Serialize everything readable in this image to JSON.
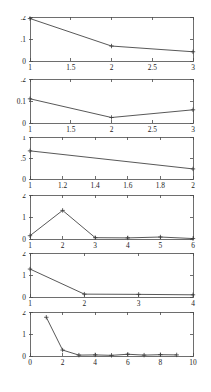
{
  "figure": {
    "title": "",
    "background_color": "#ffffff",
    "line_color": "#3a3a3a",
    "axis_color": "#4a4a4a",
    "panel_count": 6,
    "marker": "plus"
  },
  "chart_data": [
    {
      "type": "line",
      "title": "",
      "xlabel": "",
      "ylabel": "",
      "grid": false,
      "legend": null,
      "marker": "+",
      "x": [
        1,
        2,
        3
      ],
      "y": [
        0.193,
        0.068,
        0.042
      ],
      "xlim": [
        1,
        3
      ],
      "ylim": [
        0,
        0.2
      ],
      "xticks": [
        1,
        1.5,
        2,
        2.5,
        3
      ],
      "xticklabels": [
        "1",
        "1.5",
        "2",
        "2.5",
        "3"
      ],
      "yticks": [
        0,
        0.1,
        0.2
      ],
      "yticklabels": [
        "0",
        ".1",
        ".2"
      ]
    },
    {
      "type": "line",
      "title": "",
      "xlabel": "",
      "ylabel": "",
      "grid": false,
      "legend": null,
      "marker": "+",
      "x": [
        1,
        2,
        3
      ],
      "y": [
        0.11,
        0.025,
        0.06
      ],
      "xlim": [
        1,
        3
      ],
      "ylim": [
        0,
        0.2
      ],
      "xticks": [
        1,
        1.5,
        2,
        2.5,
        3
      ],
      "xticklabels": [
        "1",
        "1.5",
        "2",
        "2.5",
        "3"
      ],
      "yticks": [
        0,
        0.1,
        0.2
      ],
      "yticklabels": [
        "0",
        "0.1",
        ".2"
      ]
    },
    {
      "type": "line",
      "title": "",
      "xlabel": "",
      "ylabel": "",
      "grid": false,
      "legend": null,
      "marker": "+",
      "x": [
        1,
        2
      ],
      "y": [
        0.67,
        0.24
      ],
      "xlim": [
        1,
        2
      ],
      "ylim": [
        0,
        1
      ],
      "xticks": [
        1,
        1.2,
        1.4,
        1.6,
        1.8,
        2
      ],
      "xticklabels": [
        "1",
        "1.2",
        "1.4",
        "1.6",
        "1.8",
        "2"
      ],
      "yticks": [
        0,
        0.5,
        1
      ],
      "yticklabels": [
        "0",
        ".5",
        "1"
      ]
    },
    {
      "type": "line",
      "title": "",
      "xlabel": "",
      "ylabel": "",
      "grid": false,
      "legend": null,
      "marker": "+",
      "x": [
        1,
        2,
        3,
        4,
        5,
        6
      ],
      "y": [
        0.15,
        1.3,
        0.06,
        0.05,
        0.09,
        0.02
      ],
      "xlim": [
        1,
        6
      ],
      "ylim": [
        0,
        2
      ],
      "xticks": [
        1,
        2,
        3,
        4,
        5,
        6
      ],
      "xticklabels": [
        "1",
        "2",
        "3",
        "4",
        "5",
        "6"
      ],
      "yticks": [
        0,
        1,
        2
      ],
      "yticklabels": [
        "0",
        "1",
        "2"
      ]
    },
    {
      "type": "line",
      "title": "",
      "xlabel": "",
      "ylabel": "",
      "grid": false,
      "legend": null,
      "marker": "+",
      "x": [
        1,
        2,
        3,
        4
      ],
      "y": [
        1.27,
        0.13,
        0.12,
        0.1
      ],
      "xlim": [
        1,
        4
      ],
      "ylim": [
        0,
        2
      ],
      "xticks": [
        1,
        2,
        3,
        4
      ],
      "xticklabels": [
        "1",
        "2",
        "3",
        "4"
      ],
      "yticks": [
        0,
        1,
        2
      ],
      "yticklabels": [
        "0",
        "1",
        "2"
      ]
    },
    {
      "type": "line",
      "title": "",
      "xlabel": "",
      "ylabel": "",
      "grid": false,
      "legend": null,
      "marker": "+",
      "x": [
        1,
        2,
        3,
        4,
        5,
        6,
        7,
        8,
        9
      ],
      "y": [
        1.76,
        0.27,
        0.04,
        0.05,
        0.03,
        0.08,
        0.04,
        0.06,
        0.05
      ],
      "xlim": [
        0,
        10
      ],
      "ylim": [
        0,
        2
      ],
      "xticks": [
        0,
        2,
        4,
        6,
        8,
        10
      ],
      "xticklabels": [
        "0",
        "2",
        "4",
        "6",
        "8",
        "10"
      ],
      "yticks": [
        0,
        1,
        2
      ],
      "yticklabels": [
        "0",
        "1",
        "2"
      ]
    }
  ]
}
